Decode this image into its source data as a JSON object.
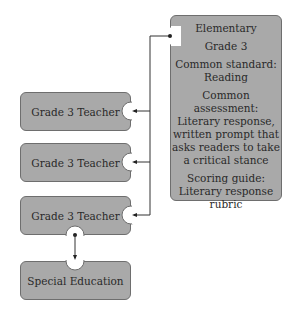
{
  "main_box": {
    "level": "Elementary",
    "grade": "Grade 3",
    "standard": "Common standard: Reading",
    "assessment": "Common assessment: Literary response, written prompt that asks readers to take a critical stance",
    "scoring": "Scoring guide: Literary response rubric"
  },
  "teachers": [
    {
      "label": "Grade 3 Teacher"
    },
    {
      "label": "Grade 3 Teacher"
    },
    {
      "label": "Grade 3 Teacher"
    }
  ],
  "special": {
    "label": "Special Education"
  },
  "colors": {
    "box_fill": "#a9a9a9",
    "box_border": "#6e6e6e",
    "line": "#333333"
  }
}
